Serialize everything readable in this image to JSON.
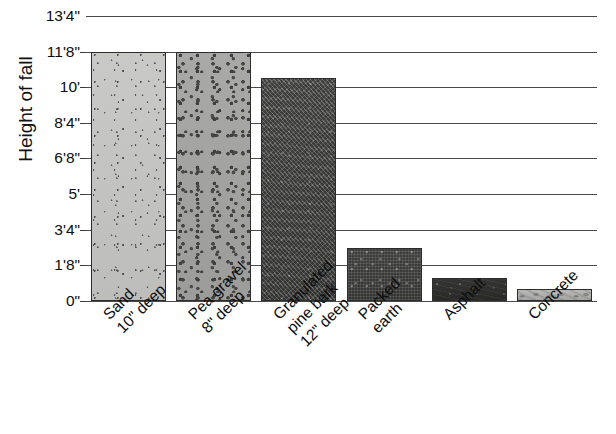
{
  "chart_data": {
    "type": "bar",
    "title": "",
    "xlabel": "",
    "ylabel": "Height of fall",
    "ylim": [
      0,
      13.3333
    ],
    "grid": true,
    "legend": "none",
    "y_unit": "feet and inches",
    "y_tick_labels": [
      "13'4\"",
      "11'8\"",
      "10'",
      "8'4\"",
      "6'8\"",
      "5'",
      "3'4\"",
      "1'8\"",
      "0\""
    ],
    "y_tick_values": [
      13.3333,
      11.6667,
      10.0,
      8.3333,
      6.6667,
      5.0,
      3.3333,
      1.6667,
      0.0
    ],
    "categories": [
      "Sand 10\" deep",
      "Pea gravel 8\" deep",
      "Granulated pine bark 12\" deep",
      "Packed earth",
      "Asphalt",
      "Concrete"
    ],
    "category_lines": [
      [
        "Sand",
        "10\" deep"
      ],
      [
        "Pea gravel",
        "8\" deep"
      ],
      [
        "Granulated",
        "pine bark",
        "12\" deep"
      ],
      [
        "Packed",
        "earth"
      ],
      [
        "Asphalt"
      ],
      [
        "Concrete"
      ]
    ],
    "values": [
      11.6667,
      11.6667,
      10.4167,
      2.5,
      1.0833,
      0.5833
    ],
    "value_labels": [
      "11'8\"",
      "11'8\"",
      "10'5\"",
      "2'6\"",
      "1'1\"",
      "0'7\""
    ],
    "bar_textures": [
      "sand",
      "pea-gravel",
      "pine-bark",
      "packed-earth",
      "asphalt",
      "concrete"
    ]
  },
  "colors": {
    "sand": "#c4c4c2",
    "pea_gravel": "#a3a3a1",
    "pine_bark": "#4a4a48",
    "packed_earth": "#3a3a38",
    "asphalt": "#2e2e2c",
    "concrete": "#b0b0ae",
    "gridline": "#4a4a4a",
    "text": "#0d0d0d",
    "background": "#ffffff"
  }
}
